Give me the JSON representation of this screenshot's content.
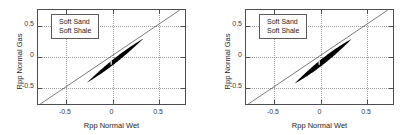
{
  "figure": {
    "background_color": "#ffffff",
    "axis_color": "#4d4d4d",
    "grid_color": "#9a9a9a",
    "data_color": "#000000",
    "reference_line_color": "#555555"
  },
  "panels": [
    {
      "name": "left-panel",
      "legend": [
        "Soft Sand",
        "Soft Shale"
      ],
      "xlabel": "Rpp Normal Wet",
      "ylabel": "Rpp Normal Gas",
      "xticks": [
        "-0.5",
        "0",
        "0.5"
      ],
      "yticks": [
        "0.5",
        "0",
        "-0.5"
      ]
    },
    {
      "name": "right-panel",
      "legend": [
        "Soft Sand",
        "Soft Shale"
      ],
      "xlabel": "Rpp Normal Wet",
      "ylabel": "Rpp Normal Gas",
      "xticks": [
        "-0.5",
        "0",
        "0.5"
      ],
      "yticks": [
        "0.5",
        "0",
        "-0.5"
      ]
    }
  ],
  "chart_data": [
    {
      "type": "scatter",
      "title": "",
      "xlabel": "Rpp Normal Wet",
      "ylabel": "Rpp Normal Gas",
      "xlim": [
        -0.8,
        0.8
      ],
      "ylim": [
        -0.78,
        0.75
      ],
      "xticks": [
        -0.5,
        0,
        0.5
      ],
      "yticks": [
        -0.5,
        0,
        0.5
      ],
      "xticklabels": [
        "-0.5",
        "0",
        "0.5"
      ],
      "yticklabels": [
        "-0.5",
        "0",
        "0.5"
      ],
      "grid": true,
      "legend": [
        "Soft Sand",
        "Soft Shale"
      ],
      "legend_position": "upper left",
      "annotations": [
        "1:1 reference line from (-0.8,-0.8) to (0.75,0.75)"
      ],
      "reference_line": {
        "x": [
          -0.8,
          0.75
        ],
        "y": [
          -0.8,
          0.75
        ]
      },
      "cloud": {
        "shape": "elongated-lens",
        "x_range": [
          -0.27,
          0.35
        ],
        "y_range": [
          -0.45,
          0.27
        ],
        "slope": 1.16,
        "intercept": -0.12,
        "half_width": 0.045,
        "tail_taper": 0.9
      }
    },
    {
      "type": "scatter",
      "title": "",
      "xlabel": "Rpp Normal Wet",
      "ylabel": "Rpp Normal Gas",
      "xlim": [
        -0.8,
        0.8
      ],
      "ylim": [
        -0.78,
        0.75
      ],
      "xticks": [
        -0.5,
        0,
        0.5
      ],
      "yticks": [
        -0.5,
        0,
        0.5
      ],
      "xticklabels": [
        "-0.5",
        "0",
        "0.5"
      ],
      "yticklabels": [
        "-0.5",
        "0",
        "0.5"
      ],
      "grid": true,
      "legend": [
        "Soft Sand",
        "Soft Shale"
      ],
      "legend_position": "upper left",
      "annotations": [
        "1:1 reference line from (-0.8,-0.8) to (0.75,0.75)"
      ],
      "reference_line": {
        "x": [
          -0.8,
          0.75
        ],
        "y": [
          -0.8,
          0.75
        ]
      },
      "cloud": {
        "shape": "elongated-lens",
        "x_range": [
          -0.27,
          0.35
        ],
        "y_range": [
          -0.45,
          0.27
        ],
        "slope": 1.16,
        "intercept": -0.13,
        "half_width": 0.055,
        "tail_taper": 0.85
      }
    }
  ]
}
